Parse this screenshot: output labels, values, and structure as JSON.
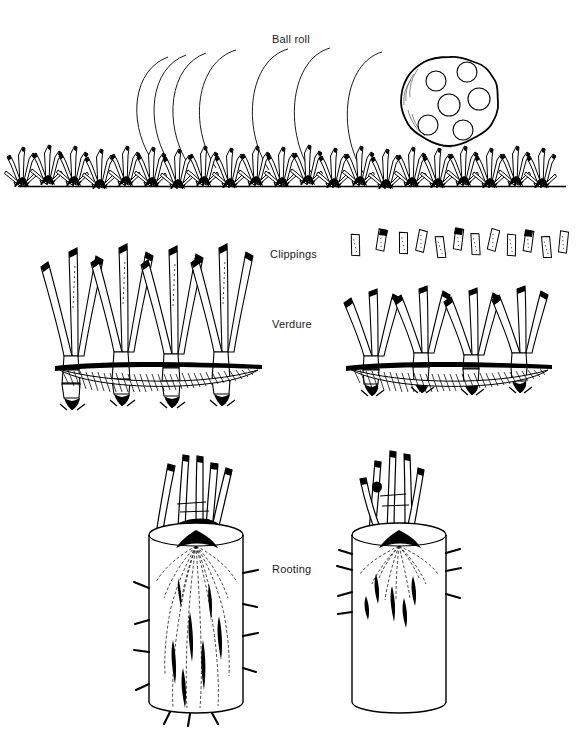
{
  "figure": {
    "type": "line-drawing-diagram",
    "background_color": "#ffffff",
    "ink_color": "#000000",
    "width": 583,
    "height": 729
  },
  "labels": {
    "ball_roll": "Ball roll",
    "clippings": "Clippings",
    "verdure": "Verdure",
    "rooting": "Rooting"
  },
  "panels": [
    {
      "id": "ball-roll",
      "label": "Ball roll",
      "description": "Golf ball rolling across a mowed turf canopy with motion arcs trailing behind it",
      "ball": {
        "dimple_count": 6,
        "center_x": 450,
        "center_y": 102,
        "radius": 45
      },
      "motion_arc_count": 7,
      "turf_tuft_count": 21,
      "ground_line_y": 186
    },
    {
      "id": "clippings-verdure",
      "label_top": "Clippings",
      "label_bottom": "Verdure",
      "description": "Two turf stands compared: left stand uncut with tall leaves, right stand mowed with removed clippings shown floating above",
      "left_stand": {
        "shoot_count": 4,
        "clippings_shown": false,
        "canopy_top_y": 232,
        "soil_line_y": 364
      },
      "right_stand": {
        "shoot_count": 4,
        "clippings_shown": true,
        "clipping_fragment_count": 12,
        "canopy_top_y": 276,
        "soil_line_y": 364
      }
    },
    {
      "id": "rooting",
      "label": "Rooting",
      "description": "Two soil cores compared: left core with deep dense root system, right core with shallow sparse roots",
      "left_core": {
        "root_depth": "deep",
        "core_top_y": 530,
        "core_bottom_y": 706,
        "shoot_count": 4
      },
      "right_core": {
        "root_depth": "shallow",
        "core_top_y": 530,
        "core_bottom_y": 706,
        "shoot_count": 4
      }
    }
  ]
}
